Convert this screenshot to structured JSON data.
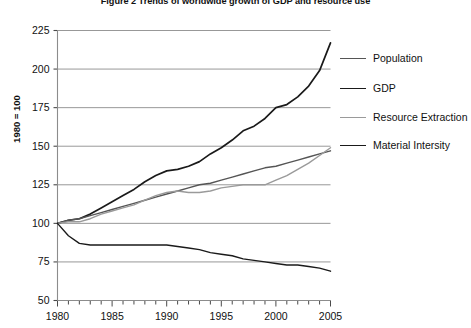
{
  "figure": {
    "title": "Figure 2   Trends of worldwide growth of GDP and resource use"
  },
  "axes": {
    "ylabel": "1980 = 100",
    "yticks": [
      "225",
      "200",
      "175",
      "150",
      "125",
      "100",
      "75",
      "50"
    ],
    "xticks": [
      "1980",
      "1985",
      "1990",
      "1995",
      "2000",
      "2005"
    ]
  },
  "legend": {
    "items": [
      {
        "label": "Population",
        "color": "#555555"
      },
      {
        "label": "GDP",
        "color": "#1a1a1a"
      },
      {
        "label": "Resource Extraction",
        "color": "#9a9a9a"
      },
      {
        "label": "Material Intersity",
        "color": "#1a1a1a"
      }
    ]
  },
  "chart_data": {
    "type": "line",
    "title": "Figure 2   Trends of worldwide growth of GDP and resource use",
    "xlabel": "",
    "ylabel": "1980 = 100",
    "xlim": [
      1980,
      2005
    ],
    "ylim": [
      50,
      225
    ],
    "grid": true,
    "legend_position": "right",
    "x": [
      1980,
      1981,
      1982,
      1983,
      1984,
      1985,
      1986,
      1987,
      1988,
      1989,
      1990,
      1991,
      1992,
      1993,
      1994,
      1995,
      1996,
      1997,
      1998,
      1999,
      2000,
      2001,
      2002,
      2003,
      2004,
      2005
    ],
    "series": [
      {
        "name": "GDP",
        "color": "#1a1a1a",
        "width": 1.7,
        "values": [
          100,
          102,
          103,
          106,
          110,
          114,
          118,
          122,
          127,
          131,
          134,
          135,
          137,
          140,
          145,
          149,
          154,
          160,
          163,
          168,
          175,
          177,
          182,
          189,
          199,
          217
        ]
      },
      {
        "name": "Population",
        "color": "#555555",
        "width": 1.4,
        "values": [
          100,
          102,
          103,
          105,
          107,
          109,
          111,
          113,
          115,
          117,
          119,
          121,
          123,
          125,
          126,
          128,
          130,
          132,
          134,
          136,
          137,
          139,
          141,
          143,
          145,
          147
        ]
      },
      {
        "name": "Resource Extraction",
        "color": "#9a9a9a",
        "width": 1.4,
        "values": [
          100,
          101,
          101,
          103,
          106,
          108,
          110,
          112,
          115,
          118,
          120,
          121,
          120,
          120,
          121,
          123,
          124,
          125,
          125,
          125,
          128,
          131,
          135,
          139,
          144,
          149
        ]
      },
      {
        "name": "Material Intersity",
        "color": "#1a1a1a",
        "width": 1.4,
        "values": [
          100,
          92,
          87,
          86,
          86,
          86,
          86,
          86,
          86,
          86,
          86,
          85,
          84,
          83,
          81,
          80,
          79,
          77,
          76,
          75,
          74,
          73,
          73,
          72,
          71,
          69
        ]
      }
    ]
  }
}
